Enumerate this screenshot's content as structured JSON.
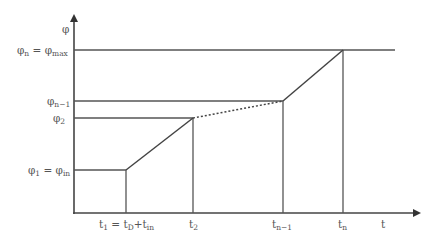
{
  "diagram": {
    "type": "piecewise-line-plot",
    "colors": {
      "line": "#444444",
      "text": "#555555",
      "background": "#ffffff"
    },
    "axes": {
      "y_label": {
        "main": "φ",
        "sub": ""
      },
      "x_label": {
        "main": "t",
        "sub": ""
      }
    },
    "y_labels": [
      {
        "id": "phi_n",
        "main": "φ",
        "sub": "n",
        "eq": " = φ",
        "sub2": "max"
      },
      {
        "id": "phi_n1",
        "main": "φ",
        "sub": "n−1"
      },
      {
        "id": "phi_2",
        "main": "φ",
        "sub": "2"
      },
      {
        "id": "phi_1",
        "main": "φ",
        "sub": "1",
        "eq": " = φ",
        "sub2": "in"
      }
    ],
    "x_labels": [
      {
        "id": "t_1",
        "main": "t",
        "sub": "1",
        "eq": " = t",
        "sub2": "D",
        "plus": "+t",
        "sub3": "in"
      },
      {
        "id": "t_2",
        "main": "t",
        "sub": "2"
      },
      {
        "id": "t_n1",
        "main": "t",
        "sub": "n−1"
      },
      {
        "id": "t_n",
        "main": "t",
        "sub": "n"
      }
    ],
    "segments": [
      {
        "from": [
          "0",
          "φ1"
        ],
        "to": [
          "t1",
          "φ1"
        ],
        "style": "solid"
      },
      {
        "from": [
          "t1",
          "φ1"
        ],
        "to": [
          "t2",
          "φ2"
        ],
        "style": "solid"
      },
      {
        "from": [
          "t2",
          "φ2"
        ],
        "to": [
          "tn-1",
          "φn-1"
        ],
        "style": "dotted"
      },
      {
        "from": [
          "tn-1",
          "φn-1"
        ],
        "to": [
          "tn",
          "φn"
        ],
        "style": "solid"
      },
      {
        "from": [
          "tn",
          "φn"
        ],
        "to": [
          "beyond",
          "φn"
        ],
        "style": "solid"
      }
    ]
  }
}
